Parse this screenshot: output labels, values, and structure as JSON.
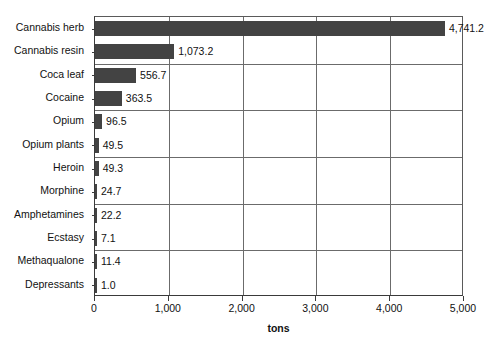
{
  "chart_data": {
    "type": "bar",
    "orientation": "horizontal",
    "title": "",
    "xlabel": "tons",
    "ylabel": "",
    "xlim": [
      0,
      5000
    ],
    "xticks": [
      0,
      1000,
      2000,
      3000,
      4000,
      5000
    ],
    "xtick_labels": [
      "0",
      "1,000",
      "2,000",
      "3,000",
      "4,000",
      "5,000"
    ],
    "grid": "vertical gridlines at each 1,000 tick; horizontal separator lines after every second category",
    "legend": "none",
    "bar_color": "#434343",
    "categories": [
      "Cannabis herb",
      "Cannabis resin",
      "Coca leaf",
      "Cocaine",
      "Opium",
      "Opium plants",
      "Heroin",
      "Morphine",
      "Amphetamines",
      "Ecstasy",
      "Methaqualone",
      "Depressants"
    ],
    "values": [
      4741.2,
      1073.2,
      556.7,
      363.5,
      96.5,
      49.5,
      49.3,
      24.7,
      22.2,
      7.1,
      11.4,
      1.0
    ],
    "value_labels": [
      "4,741.2",
      "1,073.2",
      "556.7",
      "363.5",
      "96.5",
      "49.5",
      "49.3",
      "24.7",
      "22.2",
      "7.1",
      "11.4",
      "1.0"
    ]
  }
}
